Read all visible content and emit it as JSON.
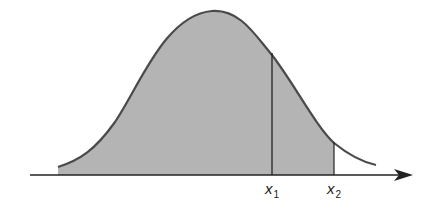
{
  "diagram": {
    "title": "",
    "type": "normal-distribution-shaded-area",
    "labels": {
      "x1": {
        "var": "x",
        "sub": "1"
      },
      "x2": {
        "var": "x",
        "sub": "2"
      }
    },
    "colors": {
      "fill": "#b4b4b4",
      "stroke": "#4a4a4a",
      "axis": "#222222",
      "background": "#ffffff"
    },
    "shaded_region": "area under curve from left tail to x2",
    "markers": [
      "x1",
      "x2"
    ]
  }
}
